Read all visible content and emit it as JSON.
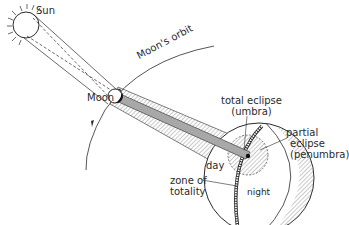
{
  "diagram": {
    "labels": {
      "sun": "Sun",
      "moon": "Moon",
      "moons_orbit": "Moon's orbit",
      "total_eclipse_line1": "total eclipse",
      "total_eclipse_line2": "(umbra)",
      "partial_eclipse_line1": "partial",
      "partial_eclipse_line2": "eclipse",
      "partial_eclipse_line3": "(penumbra)",
      "day": "day",
      "night": "night",
      "zone_of_totality_line1": "zone of",
      "zone_of_totality_line2": "totality"
    },
    "colors": {
      "ink": "#2a2a2a",
      "umbra_fill": "#a8a8a8",
      "penumbra_hatch": "#6a6a6a",
      "background": "#ffffff"
    }
  }
}
